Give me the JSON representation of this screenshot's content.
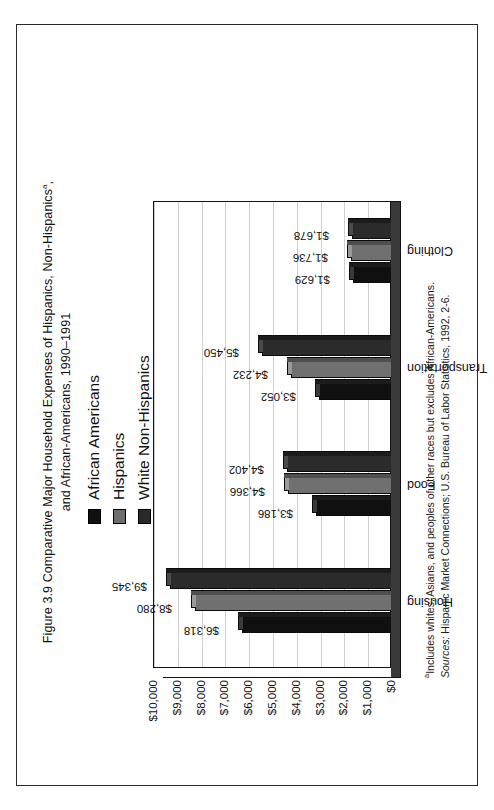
{
  "figure": {
    "caption_line1_prefix": "Figure 3.9  Comparative Major Household Expenses of Hispanics, Non-Hispanics",
    "caption_superscript": "a",
    "caption_line1_suffix": ",",
    "caption_line2": "and African-Americans, 1990–1991"
  },
  "legend": {
    "position": "top-center",
    "items": [
      {
        "label": "African Americans",
        "color": "#101010",
        "swatch": "legend-swatch-african-americans"
      },
      {
        "label": "Hispanics",
        "color": "#707070",
        "swatch": "legend-swatch-hispanics"
      },
      {
        "label": "White Non-Hispanics",
        "color": "#2b2b2b",
        "swatch": "legend-swatch-white-non-hispanics"
      }
    ]
  },
  "footnote": {
    "superscript": "a",
    "note": "Includes whites, Asians, and peoples of other races but excludes African-Americans.",
    "sources_label": "Sources:",
    "sources_text": " Hispanic Market Connections; U.S. Bureau of Labor Statistics, 1992, 2-6."
  },
  "chart_data": {
    "type": "bar",
    "xlabel": "",
    "ylabel": "",
    "ylim": [
      0,
      10000
    ],
    "ytick_step": 1000,
    "ytick_labels": [
      "$0",
      "$1,000",
      "$2,000",
      "$3,000",
      "$4,000",
      "$5,000",
      "$6,000",
      "$7,000",
      "$8,000",
      "$9,000",
      "$10,000"
    ],
    "grid": true,
    "legend_position": "top",
    "categories": [
      "Housing",
      "Food",
      "Transportation",
      "Clothing"
    ],
    "series": [
      {
        "name": "African Americans",
        "color": "#101010",
        "values": [
          6318,
          3186,
          3052,
          1629
        ],
        "labels": [
          "$6,318",
          "$3,186",
          "$3,052",
          "$1,629"
        ]
      },
      {
        "name": "Hispanics",
        "color": "#707070",
        "values": [
          8280,
          4366,
          4232,
          1736
        ],
        "labels": [
          "$8,280",
          "$4,366",
          "$4,232",
          "$1,736"
        ]
      },
      {
        "name": "White Non-Hispanics",
        "color": "#2b2b2b",
        "values": [
          9345,
          4402,
          5450,
          1678
        ],
        "labels": [
          "$9,345",
          "$4,402",
          "$5,450",
          "$1,678"
        ]
      }
    ]
  }
}
